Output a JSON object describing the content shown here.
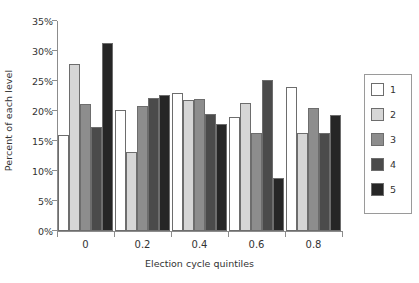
{
  "chart_data": {
    "type": "bar",
    "title": "",
    "xlabel": "Election cycle quintiles",
    "ylabel": "Percent of each level",
    "categories": [
      "0",
      "0.2",
      "0.4",
      "0.6",
      "0.8"
    ],
    "ylim": [
      0,
      35
    ],
    "ytick_labels": [
      "0%",
      "5%",
      "10%",
      "15%",
      "20%",
      "25%",
      "30%",
      "35%"
    ],
    "ytick_values": [
      0,
      5,
      10,
      15,
      20,
      25,
      30,
      35
    ],
    "grid": false,
    "legend_position": "right",
    "series": [
      {
        "name": "1",
        "color": "#ffffff",
        "values": [
          16.0,
          20.1,
          23.0,
          19.0,
          24.0
        ]
      },
      {
        "name": "2",
        "color": "#d6d6d6",
        "values": [
          27.9,
          13.2,
          21.8,
          21.3,
          16.4
        ]
      },
      {
        "name": "3",
        "color": "#8d8d8d",
        "values": [
          21.1,
          20.9,
          22.0,
          16.3,
          20.5
        ]
      },
      {
        "name": "4",
        "color": "#4b4b4b",
        "values": [
          17.4,
          22.2,
          19.5,
          25.2,
          16.4
        ]
      },
      {
        "name": "5",
        "color": "#262626",
        "values": [
          31.3,
          22.6,
          17.8,
          8.8,
          19.4
        ]
      }
    ]
  },
  "legend": {
    "items": [
      {
        "label": "1"
      },
      {
        "label": "2"
      },
      {
        "label": "3"
      },
      {
        "label": "4"
      },
      {
        "label": "5"
      }
    ]
  },
  "axes": {
    "y_title": "Percent of each level",
    "x_title": "Election cycle quintiles"
  }
}
